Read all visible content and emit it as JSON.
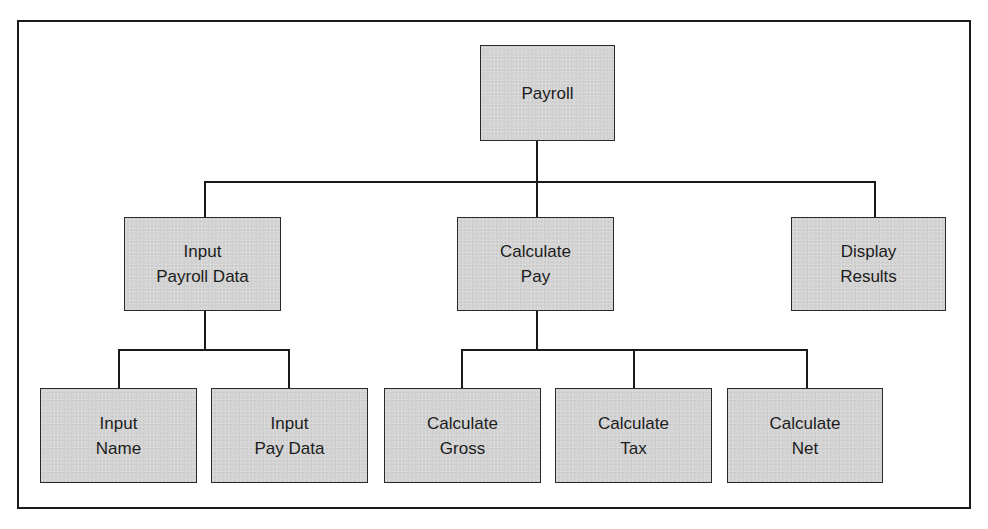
{
  "diagram": {
    "type": "hierarchy-chart",
    "root": {
      "id": "payroll",
      "lines": [
        "Payroll"
      ],
      "children": [
        {
          "id": "input-payroll-data",
          "lines": [
            "Input",
            "Payroll Data"
          ],
          "children": [
            {
              "id": "input-name",
              "lines": [
                "Input",
                "Name"
              ]
            },
            {
              "id": "input-pay-data",
              "lines": [
                "Input",
                "Pay Data"
              ]
            }
          ]
        },
        {
          "id": "calculate-pay",
          "lines": [
            "Calculate",
            "Pay"
          ],
          "children": [
            {
              "id": "calculate-gross",
              "lines": [
                "Calculate",
                "Gross"
              ]
            },
            {
              "id": "calculate-tax",
              "lines": [
                "Calculate",
                "Tax"
              ]
            },
            {
              "id": "calculate-net",
              "lines": [
                "Calculate",
                "Net"
              ]
            }
          ]
        },
        {
          "id": "display-results",
          "lines": [
            "Display",
            "Results"
          ]
        }
      ]
    },
    "colors": {
      "box_fill": "#d4d4d4",
      "box_border": "#2a2a2a",
      "connector": "#1a1a1a",
      "frame": "#1a1a1a",
      "background": "#ffffff"
    }
  }
}
